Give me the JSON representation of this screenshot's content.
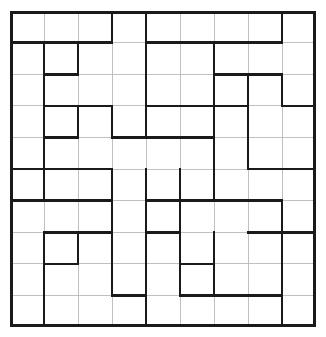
{
  "puzzle": {
    "title": "Polyomino Region Grid Puzzle",
    "type": "region-partition-grid",
    "columns": 9,
    "rows": 10,
    "cell_width": 34,
    "cell_height": 31.6,
    "origin_x": 10,
    "origin_y": 11,
    "colors": {
      "background": "#ffffff",
      "thin_grid": "#b9b9b9",
      "thick_border": "#1a1a1a",
      "cell_fill": "#ffffff"
    },
    "line_widths": {
      "thin": 0.9,
      "thick": 2.6,
      "outer": 3.0
    },
    "cells_total": 90,
    "horizontal_thick_segments": [
      {
        "row": 1,
        "col_start": 0,
        "col_end": 3
      },
      {
        "row": 1,
        "col_start": 4,
        "col_end": 8
      },
      {
        "row": 2,
        "col_start": 1,
        "col_end": 2
      },
      {
        "row": 2,
        "col_start": 6,
        "col_end": 8
      },
      {
        "row": 3,
        "col_start": 1,
        "col_end": 3
      },
      {
        "row": 3,
        "col_start": 4,
        "col_end": 7
      },
      {
        "row": 3,
        "col_start": 8,
        "col_end": 9
      },
      {
        "row": 4,
        "col_start": 1,
        "col_end": 2
      },
      {
        "row": 4,
        "col_start": 3,
        "col_end": 6
      },
      {
        "row": 5,
        "col_start": 0,
        "col_end": 3
      },
      {
        "row": 5,
        "col_start": 7,
        "col_end": 9
      },
      {
        "row": 6,
        "col_start": 0,
        "col_end": 3
      },
      {
        "row": 6,
        "col_start": 4,
        "col_end": 5
      },
      {
        "row": 6,
        "col_start": 5,
        "col_end": 8
      },
      {
        "row": 7,
        "col_start": 1,
        "col_end": 3
      },
      {
        "row": 7,
        "col_start": 4,
        "col_end": 5
      },
      {
        "row": 7,
        "col_start": 7,
        "col_end": 9
      },
      {
        "row": 8,
        "col_start": 1,
        "col_end": 2
      },
      {
        "row": 8,
        "col_start": 5,
        "col_end": 6
      },
      {
        "row": 9,
        "col_start": 3,
        "col_end": 4
      },
      {
        "row": 9,
        "col_start": 5,
        "col_end": 8
      }
    ],
    "vertical_thick_segments": [
      {
        "col": 3,
        "row_start": 0,
        "row_end": 1
      },
      {
        "col": 4,
        "row_start": 0,
        "row_end": 4
      },
      {
        "col": 8,
        "row_start": 0,
        "row_end": 1
      },
      {
        "col": 1,
        "row_start": 1,
        "row_end": 2
      },
      {
        "col": 2,
        "row_start": 1,
        "row_end": 2
      },
      {
        "col": 6,
        "row_start": 1,
        "row_end": 3
      },
      {
        "col": 1,
        "row_start": 2,
        "row_end": 4
      },
      {
        "col": 7,
        "row_start": 2,
        "row_end": 5
      },
      {
        "col": 8,
        "row_start": 2,
        "row_end": 3
      },
      {
        "col": 2,
        "row_start": 3,
        "row_end": 4
      },
      {
        "col": 3,
        "row_start": 3,
        "row_end": 4
      },
      {
        "col": 6,
        "row_start": 3,
        "row_end": 6
      },
      {
        "col": 1,
        "row_start": 4,
        "row_end": 6
      },
      {
        "col": 3,
        "row_start": 5,
        "row_end": 6
      },
      {
        "col": 4,
        "row_start": 5,
        "row_end": 7
      },
      {
        "col": 5,
        "row_start": 5,
        "row_end": 6
      },
      {
        "col": 3,
        "row_start": 6,
        "row_end": 9
      },
      {
        "col": 5,
        "row_start": 6,
        "row_end": 8
      },
      {
        "col": 8,
        "row_start": 6,
        "row_end": 10
      },
      {
        "col": 1,
        "row_start": 7,
        "row_end": 8
      },
      {
        "col": 2,
        "row_start": 7,
        "row_end": 8
      },
      {
        "col": 4,
        "row_start": 7,
        "row_end": 10
      },
      {
        "col": 6,
        "row_start": 7,
        "row_end": 9
      },
      {
        "col": 1,
        "row_start": 8,
        "row_end": 10
      },
      {
        "col": 5,
        "row_start": 8,
        "row_end": 9
      }
    ]
  }
}
